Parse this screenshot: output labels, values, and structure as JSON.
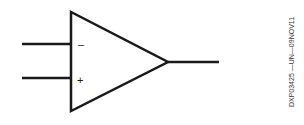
{
  "diagram": {
    "type": "operational-amplifier-symbol",
    "inputs": [
      {
        "name": "inverting",
        "label": "–"
      },
      {
        "name": "non-inverting",
        "label": "+"
      }
    ],
    "output": {
      "name": "output"
    },
    "line_color": "#1a1a1a"
  },
  "figure_id": "DXP03425 —UN—09NOV11"
}
